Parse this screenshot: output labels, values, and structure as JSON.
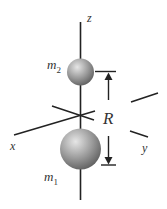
{
  "diagram": {
    "axes": {
      "z": "z",
      "x": "x",
      "y": "y"
    },
    "masses": {
      "m2": {
        "base": "m",
        "sub": "2"
      },
      "m1": {
        "base": "m",
        "sub": "1"
      }
    },
    "distance_label": "R",
    "colors": {
      "line": "#222222",
      "sphere_light": "#d8d8d8",
      "sphere_dark": "#6a6a6a",
      "text": "#333333"
    }
  }
}
